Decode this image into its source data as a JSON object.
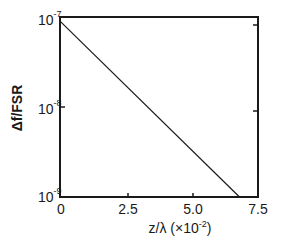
{
  "chart_data": {
    "type": "line",
    "title": "",
    "xlabel": "z/λ (×10⁻²)",
    "ylabel": "Δf/FSR",
    "xlim": [
      0,
      7.5
    ],
    "ylim": [
      1e-09,
      1e-07
    ],
    "yscale": "log",
    "grid": false,
    "legend": null,
    "x_ticks": [
      "0",
      "2.5",
      "5.0",
      "7.5"
    ],
    "y_ticks": [
      {
        "base": "10",
        "exp": "-7"
      },
      {
        "base": "10",
        "exp": "-8"
      },
      {
        "base": "10",
        "exp": "-9"
      }
    ],
    "series": [
      {
        "name": "Δf/FSR",
        "x": [
          0,
          6.8
        ],
        "y": [
          9e-08,
          1e-09
        ]
      }
    ]
  },
  "labels": {
    "x_axis_main": "z/λ (×10",
    "x_axis_exp": "-2",
    "x_axis_close": ")",
    "y_axis": "Δf/FSR"
  }
}
